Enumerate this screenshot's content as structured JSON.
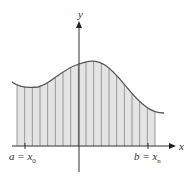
{
  "diagram": {
    "type": "riemann-sum-area-under-curve",
    "axis_labels": {
      "x": "x",
      "y": "y"
    },
    "left_label": {
      "text": "a = x",
      "sub": "0"
    },
    "right_label": {
      "text": "b = x",
      "sub": "n"
    },
    "strip_count": 18,
    "colors": {
      "fill": "#e4e4e4",
      "curve": "#555555",
      "axis": "#333333",
      "strip_line": "#777777"
    }
  }
}
